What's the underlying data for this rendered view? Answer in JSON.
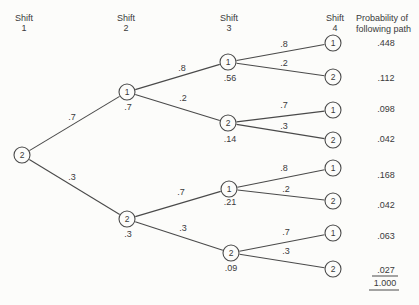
{
  "columns": [
    {
      "label": "Shift",
      "number": "1"
    },
    {
      "label": "Shift",
      "number": "2"
    },
    {
      "label": "Shift",
      "number": "3"
    },
    {
      "label": "Shift",
      "number": "4"
    }
  ],
  "prob_header": {
    "line1": "Probability of",
    "line2": "following path"
  },
  "tree": {
    "node_radius": 8,
    "nodes": [
      {
        "id": "s1-2",
        "label": "2",
        "x": 22,
        "y": 155,
        "sub": "",
        "subx": 0,
        "suby": 0
      },
      {
        "id": "s2-1",
        "label": "1",
        "x": 127,
        "y": 92,
        "sub": ".7",
        "subx": 128,
        "suby": 107
      },
      {
        "id": "s2-2",
        "label": "2",
        "x": 127,
        "y": 219,
        "sub": ".3",
        "subx": 128,
        "suby": 234
      },
      {
        "id": "s3-1a",
        "label": "1",
        "x": 228,
        "y": 62,
        "sub": ".56",
        "subx": 230,
        "suby": 78
      },
      {
        "id": "s3-2a",
        "label": "2",
        "x": 228,
        "y": 123,
        "sub": ".14",
        "subx": 230,
        "suby": 139
      },
      {
        "id": "s3-1b",
        "label": "1",
        "x": 229,
        "y": 189,
        "sub": ".21",
        "subx": 230,
        "suby": 202
      },
      {
        "id": "s3-2b",
        "label": "2",
        "x": 231,
        "y": 253,
        "sub": ".09",
        "subx": 231,
        "suby": 268
      },
      {
        "id": "s4-1a",
        "label": "1",
        "x": 333,
        "y": 43,
        "sub": "",
        "subx": 0,
        "suby": 0
      },
      {
        "id": "s4-2a",
        "label": "2",
        "x": 333,
        "y": 77,
        "sub": "",
        "subx": 0,
        "suby": 0
      },
      {
        "id": "s4-1b",
        "label": "1",
        "x": 333,
        "y": 110,
        "sub": "",
        "subx": 0,
        "suby": 0
      },
      {
        "id": "s4-2b",
        "label": "2",
        "x": 333,
        "y": 140,
        "sub": "",
        "subx": 0,
        "suby": 0
      },
      {
        "id": "s4-1c",
        "label": "1",
        "x": 333,
        "y": 168,
        "sub": "",
        "subx": 0,
        "suby": 0
      },
      {
        "id": "s4-2c",
        "label": "2",
        "x": 333,
        "y": 201,
        "sub": "",
        "subx": 0,
        "suby": 0
      },
      {
        "id": "s4-1d",
        "label": "1",
        "x": 333,
        "y": 233,
        "sub": "",
        "subx": 0,
        "suby": 0
      },
      {
        "id": "s4-2d",
        "label": "2",
        "x": 333,
        "y": 269,
        "sub": "",
        "subx": 0,
        "suby": 0
      }
    ],
    "edges": [
      {
        "from": "s1-2",
        "to": "s2-1",
        "label": ".7",
        "lx": 72,
        "ly": 117
      },
      {
        "from": "s1-2",
        "to": "s2-2",
        "label": ".3",
        "lx": 72,
        "ly": 177
      },
      {
        "from": "s2-1",
        "to": "s3-1a",
        "label": ".8",
        "lx": 182,
        "ly": 68
      },
      {
        "from": "s2-1",
        "to": "s3-2a",
        "label": ".2",
        "lx": 183,
        "ly": 98
      },
      {
        "from": "s2-2",
        "to": "s3-1b",
        "label": ".7",
        "lx": 181,
        "ly": 192
      },
      {
        "from": "s2-2",
        "to": "s3-2b",
        "label": ".3",
        "lx": 183,
        "ly": 228
      },
      {
        "from": "s3-1a",
        "to": "s4-1a",
        "label": ".8",
        "lx": 284,
        "ly": 44
      },
      {
        "from": "s3-1a",
        "to": "s4-2a",
        "label": ".2",
        "lx": 284,
        "ly": 63
      },
      {
        "from": "s3-2a",
        "to": "s4-1b",
        "label": ".7",
        "lx": 284,
        "ly": 105
      },
      {
        "from": "s3-2a",
        "to": "s4-2b",
        "label": ".3",
        "lx": 284,
        "ly": 126
      },
      {
        "from": "s3-1b",
        "to": "s4-1c",
        "label": ".8",
        "lx": 284,
        "ly": 168
      },
      {
        "from": "s3-1b",
        "to": "s4-2c",
        "label": ".2",
        "lx": 286,
        "ly": 189
      },
      {
        "from": "s3-2b",
        "to": "s4-1d",
        "label": ".7",
        "lx": 286,
        "ly": 232
      },
      {
        "from": "s3-2b",
        "to": "s4-2d",
        "label": ".3",
        "lx": 286,
        "ly": 251
      }
    ],
    "prob_col_x": 386,
    "probabilities": [
      {
        "value": ".448",
        "y": 43
      },
      {
        "value": ".112",
        "y": 78
      },
      {
        "value": ".098",
        "y": 109
      },
      {
        "value": ".042",
        "y": 139
      },
      {
        "value": ".168",
        "y": 175
      },
      {
        "value": ".042",
        "y": 205
      },
      {
        "value": ".063",
        "y": 236
      },
      {
        "value": ".027",
        "y": 270
      }
    ],
    "rules": [
      {
        "x1": 372,
        "x2": 398,
        "y": 276
      },
      {
        "x1": 369,
        "x2": 399,
        "y": 290
      }
    ],
    "total": {
      "value": "1.000",
      "x": 385,
      "y": 283
    }
  },
  "colors": {
    "background": "#fcfcfa",
    "ink": "#3a3a3a",
    "line": "#4a4a4a",
    "node_fill": "#fcfcfa"
  }
}
